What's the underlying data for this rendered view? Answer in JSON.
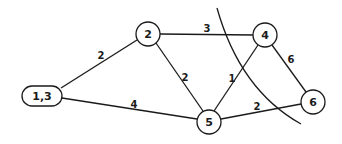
{
  "diagram": {
    "type": "weighted-graph",
    "colors": {
      "stroke": "#1a1a1a",
      "background": "#ffffff"
    },
    "nodes": [
      {
        "id": "n13",
        "label": "1,3",
        "shape": "pill",
        "x": 42,
        "y": 96
      },
      {
        "id": "n2",
        "label": "2",
        "shape": "circle",
        "x": 148,
        "y": 34
      },
      {
        "id": "n4",
        "label": "4",
        "shape": "circle",
        "x": 265,
        "y": 35
      },
      {
        "id": "n5",
        "label": "5",
        "shape": "circle",
        "x": 209,
        "y": 122
      },
      {
        "id": "n6",
        "label": "6",
        "shape": "circle",
        "x": 313,
        "y": 102
      }
    ],
    "edges": [
      {
        "from": "1,3",
        "to": "2",
        "weight": "2"
      },
      {
        "from": "1,3",
        "to": "5",
        "weight": "4"
      },
      {
        "from": "2",
        "to": "4",
        "weight": "3"
      },
      {
        "from": "2",
        "to": "5",
        "weight": "2"
      },
      {
        "from": "4",
        "to": "5",
        "weight": "1"
      },
      {
        "from": "4",
        "to": "6",
        "weight": "6"
      },
      {
        "from": "5",
        "to": "6",
        "weight": "2"
      }
    ],
    "cut_curve": {
      "description": "curved line cutting edges 2-4, 4-5, 5-6"
    }
  }
}
